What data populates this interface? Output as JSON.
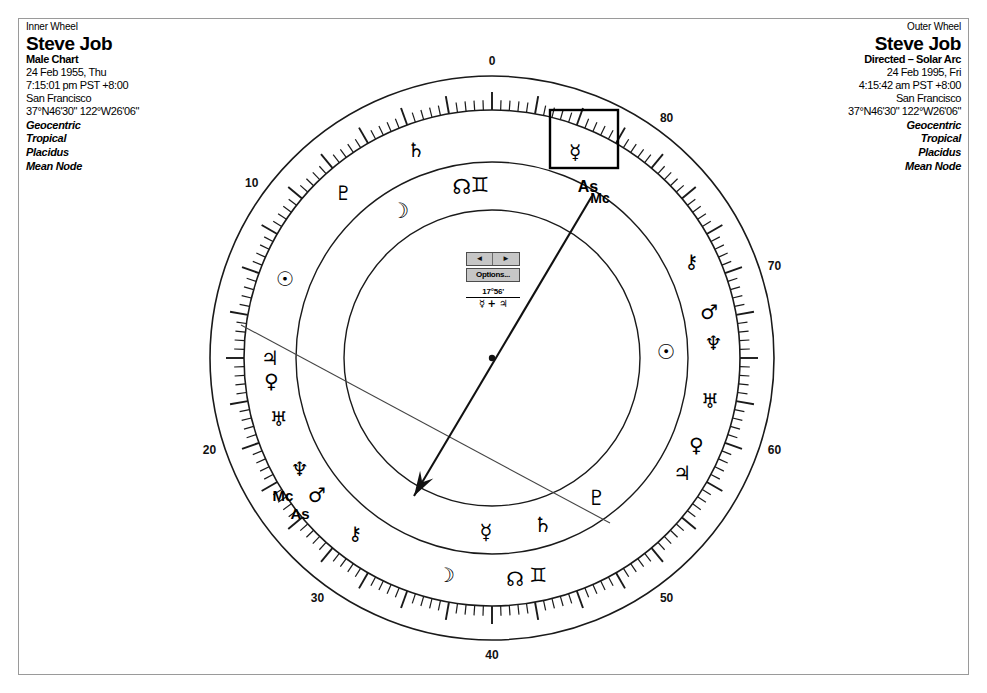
{
  "window": {
    "title": "Astrology Bi-Wheel Chart",
    "background_color": "#ffffff",
    "frame_color": "#9a9a9a"
  },
  "inner_wheel": {
    "heading": "Inner Wheel",
    "name": "Steve Job",
    "chart_type": "Male Chart",
    "date": "24 Feb 1955, Thu",
    "time": "7:15:01 pm PST +8:00",
    "place": "San Francisco",
    "coordinates": "37°N46'30\" 122°W26'06\"",
    "option_1": "Geocentric",
    "option_2": "Tropical",
    "option_3": "Placidus",
    "option_4": "Mean Node"
  },
  "outer_wheel": {
    "heading": "Outer Wheel",
    "name": "Steve Job",
    "chart_type": "Directed – Solar Arc",
    "date": "24 Feb 1995, Fri",
    "time": "4:15:42 am PST +8:00",
    "place": "San Francisco",
    "coordinates": "37°N46'30\" 122°W26'06\"",
    "option_1": "Geocentric",
    "option_2": "Tropical",
    "option_3": "Placidus",
    "option_4": "Mean Node"
  },
  "center_widget": {
    "prev_label": "◄",
    "next_label": "►",
    "options_label": "Options...",
    "readout_degrees": "17°56'",
    "readout_aspect": "☿ + ♃"
  },
  "chart_data": {
    "type": "wheel",
    "center": {
      "x": 492,
      "y": 358
    },
    "rings": [
      {
        "name": "outer-degree-ring-outer-edge",
        "radius": 282
      },
      {
        "name": "outer-degree-ring-inner-edge",
        "radius": 248
      },
      {
        "name": "outer-planet-ring-inner-edge",
        "radius": 196
      },
      {
        "name": "inner-planet-ring-inner-edge",
        "radius": 148
      }
    ],
    "degree_scale": {
      "major_tick_interval": 10,
      "minor_tick_interval": 2,
      "labels": [
        {
          "value": "0",
          "angle": 0
        },
        {
          "value": "10",
          "angle": 306
        },
        {
          "value": "20",
          "angle": 252
        },
        {
          "value": "30",
          "angle": 216
        },
        {
          "value": "40",
          "angle": 180
        },
        {
          "value": "50",
          "angle": 144
        },
        {
          "value": "60",
          "angle": 108
        },
        {
          "value": "70",
          "angle": 72
        },
        {
          "value": "80",
          "angle": 36
        }
      ]
    },
    "outer_ring_glyphs": [
      {
        "symbol": "♇",
        "name": "pluto",
        "angle": 318,
        "size": 20
      },
      {
        "symbol": "♄",
        "name": "saturn",
        "angle": 340,
        "size": 20
      },
      {
        "symbol": "☿",
        "name": "mercury",
        "angle": 22,
        "size": 20,
        "selected": true
      },
      {
        "symbol": "⚷",
        "name": "chiron",
        "angle": 64,
        "size": 19
      },
      {
        "symbol": "♂",
        "name": "mars",
        "angle": 78,
        "size": 20
      },
      {
        "symbol": "♆",
        "name": "neptune",
        "angle": 86,
        "size": 20
      },
      {
        "symbol": "♅",
        "name": "uranus",
        "angle": 101,
        "size": 20
      },
      {
        "symbol": "♀",
        "name": "venus",
        "angle": 113,
        "size": 20
      },
      {
        "symbol": "♃",
        "name": "jupiter",
        "angle": 121,
        "size": 20
      },
      {
        "symbol": "♊",
        "name": "south-node",
        "angle": 168,
        "size": 20
      },
      {
        "symbol": "☊",
        "name": "north-node",
        "angle": 174,
        "size": 20
      },
      {
        "symbol": "☽",
        "name": "moon",
        "angle": 192,
        "size": 20
      },
      {
        "symbol": "⚷",
        "name": "chiron-2",
        "angle": 218,
        "size": 19
      },
      {
        "symbol": "♂",
        "name": "mars-2",
        "angle": 232,
        "size": 20
      },
      {
        "symbol": "♆",
        "name": "neptune-2",
        "angle": 240,
        "size": 20
      },
      {
        "symbol": "♅",
        "name": "uranus-2",
        "angle": 254,
        "size": 20
      },
      {
        "symbol": "♀",
        "name": "venus-2",
        "angle": 264,
        "size": 20
      },
      {
        "symbol": "♃",
        "name": "jupiter-2",
        "angle": 270,
        "size": 20
      },
      {
        "symbol": "☉",
        "name": "sun",
        "angle": 291,
        "size": 20
      }
    ],
    "inner_ring_glyphs": [
      {
        "symbol": "☊",
        "name": "north-node-inner",
        "angle": 350,
        "size": 21
      },
      {
        "symbol": "♊",
        "name": "south-node-inner",
        "angle": 356,
        "size": 21
      },
      {
        "symbol": "☽",
        "name": "moon-inner",
        "angle": 328,
        "size": 21
      },
      {
        "symbol": "☉",
        "name": "sun-inner",
        "angle": 88,
        "size": 21
      },
      {
        "symbol": "♇",
        "name": "pluto-inner",
        "angle": 143,
        "size": 21
      },
      {
        "symbol": "♄",
        "name": "saturn-inner",
        "angle": 163,
        "size": 21
      },
      {
        "symbol": "☿",
        "name": "mercury-inner",
        "angle": 182,
        "size": 21
      }
    ],
    "angle_labels": [
      {
        "text": "As",
        "name": "ascendant-outer",
        "x": 588,
        "y": 192,
        "size": 16
      },
      {
        "text": "Mc",
        "name": "midheaven-outer",
        "x": 600,
        "y": 203,
        "size": 14
      },
      {
        "text": "Mc",
        "name": "midheaven-inner",
        "x": 283,
        "y": 501,
        "size": 15
      },
      {
        "text": "As",
        "name": "ascendant-inner",
        "x": 300,
        "y": 519,
        "size": 15
      }
    ],
    "aspect_lines": [
      {
        "name": "aspect-line-1",
        "x1": 241,
        "y1": 325,
        "x2": 610,
        "y2": 523
      }
    ],
    "pointer": {
      "name": "direction-arrow",
      "x1": 592,
      "y1": 196,
      "x2": 414,
      "y2": 496,
      "arrowhead": true
    },
    "selection_box": {
      "name": "mercury-selection-box",
      "x": 550,
      "y": 110,
      "width": 68,
      "height": 58
    }
  }
}
